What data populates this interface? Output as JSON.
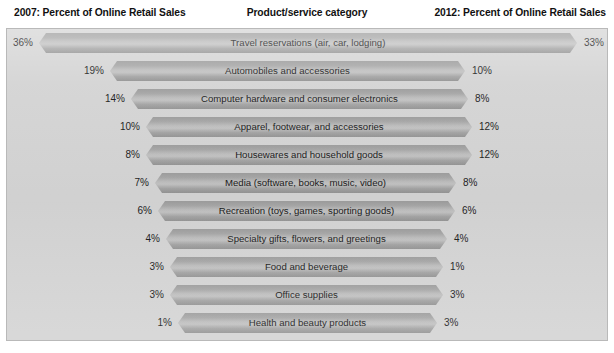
{
  "header": {
    "left": "2007: Percent of Online Retail Sales",
    "center": "Product/service category",
    "right": "2012: Percent of Online Retail Sales"
  },
  "colors": {
    "panel_background": "#d4d4d4",
    "panel_border": "#b9b9b9",
    "bar_fill": "#aaaaaa",
    "bar_highlight": "#c2c2c2",
    "text": "#1a1a1a",
    "page_background": "#ffffff"
  },
  "chart_data": {
    "type": "bar",
    "title": "",
    "subtitle": "",
    "xlabel": "",
    "ylabel": "Product/service category",
    "grid": false,
    "legend_position": "none",
    "orientation": "horizontal",
    "layout": "diverging-centered",
    "note": "Each row is a single centered tapered bar whose width encodes the 2007 value; the 2007 value is labeled at the left end and the 2012 value at the right end.",
    "categories": [
      "Travel reservations (air, car, lodging)",
      "Automobiles and accessories",
      "Computer hardware and consumer electronics",
      "Apparel, footwear, and accessories",
      "Housewares and household goods",
      "Media (software, books, music, video)",
      "Recreation (toys, games, sporting goods)",
      "Specialty gifts, flowers, and greetings",
      "Food and beverage",
      "Office supplies",
      "Health and beauty products"
    ],
    "series": [
      {
        "name": "2007: Percent of Online Retail Sales",
        "values": [
          36,
          19,
          14,
          10,
          8,
          7,
          6,
          4,
          3,
          3,
          1
        ],
        "labels": [
          "36%",
          "19%",
          "14%",
          "10%",
          "8%",
          "7%",
          "6%",
          "4%",
          "3%",
          "3%",
          "1%"
        ]
      },
      {
        "name": "2012: Percent of Online Retail Sales",
        "values": [
          33,
          10,
          8,
          12,
          12,
          8,
          6,
          4,
          1,
          3,
          3
        ],
        "labels": [
          "33%",
          "10%",
          "8%",
          "12%",
          "12%",
          "8%",
          "6%",
          "4%",
          "1%",
          "3%",
          "3%"
        ]
      }
    ],
    "ylim": [
      0,
      40
    ]
  },
  "rows": [
    {
      "label": "Travel reservations (air, car, lodging)",
      "left": "36%",
      "right": "33%",
      "bar_left": 32,
      "bar_width": 538,
      "top": 4
    },
    {
      "label": "Automobiles and accessories",
      "left": "19%",
      "right": "10%",
      "bar_left": 103,
      "bar_width": 355,
      "top": 32
    },
    {
      "label": "Computer hardware and consumer electronics",
      "left": "14%",
      "right": "8%",
      "bar_left": 124,
      "bar_width": 337,
      "top": 60
    },
    {
      "label": "Apparel, footwear, and accessories",
      "left": "10%",
      "right": "12%",
      "bar_left": 139,
      "bar_width": 326,
      "top": 88
    },
    {
      "label": "Housewares and household goods",
      "left": "8%",
      "right": "12%",
      "bar_left": 139,
      "bar_width": 326,
      "top": 116
    },
    {
      "label": "Media (software, books, music, video)",
      "left": "7%",
      "right": "8%",
      "bar_left": 148,
      "bar_width": 301,
      "top": 144
    },
    {
      "label": "Recreation (toys, games, sporting goods)",
      "left": "6%",
      "right": "6%",
      "bar_left": 151,
      "bar_width": 297,
      "top": 172
    },
    {
      "label": "Specialty gifts, flowers, and greetings",
      "left": "4%",
      "right": "4%",
      "bar_left": 159,
      "bar_width": 281,
      "top": 200
    },
    {
      "label": "Food and beverage",
      "left": "3%",
      "right": "1%",
      "bar_left": 163,
      "bar_width": 273,
      "top": 228
    },
    {
      "label": "Office supplies",
      "left": "3%",
      "right": "3%",
      "bar_left": 163,
      "bar_width": 273,
      "top": 256
    },
    {
      "label": "Health and beauty products",
      "left": "1%",
      "right": "3%",
      "bar_left": 171,
      "bar_width": 259,
      "top": 284
    }
  ]
}
